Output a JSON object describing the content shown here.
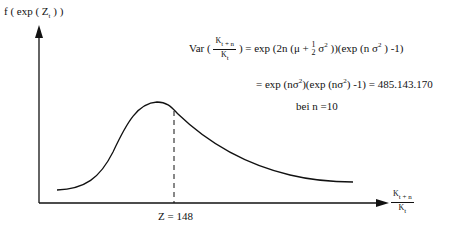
{
  "diagram": {
    "y_axis_label": {
      "f": "f ( exp ( Z",
      "sub": "t",
      "close": " ) )"
    },
    "x_axis_label": {
      "numerator": "K",
      "numerator_sub": "t + n",
      "denominator": "K",
      "denominator_sub": "t"
    },
    "marker_label": "Z = 148",
    "formula": {
      "line1_prefix": "Var (",
      "line1_frac_num": "K",
      "line1_frac_num_sub": "t + n",
      "line1_frac_den": "K",
      "line1_frac_den_sub": "t",
      "line1_a": ") = exp (2n (μ + ",
      "line1_half_num": "1",
      "line1_half_den": "2",
      "line1_b": " σ",
      "line1_b_sup": "2",
      "line1_c": " ))(exp (n σ",
      "line1_c_sup": "2",
      "line1_d": " ) -1)",
      "line2_a": "= exp (nσ",
      "line2_a_sup": "2",
      "line2_b": ")(exp (nσ",
      "line2_b_sup": "2",
      "line2_c": ") -1) = 485.143.170",
      "line3": "bei n =10"
    },
    "curve": {
      "type": "right-skewed density (lognormal)",
      "mode_position": "left of marker",
      "marker_value": 148
    }
  }
}
